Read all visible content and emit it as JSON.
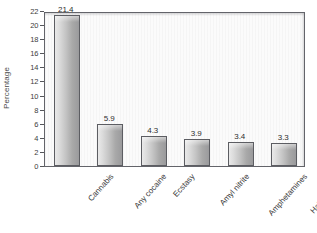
{
  "chart_data": {
    "type": "bar",
    "title": "",
    "xlabel": "",
    "ylabel": "Percentage",
    "ylim": [
      0,
      22
    ],
    "ytick_step": 2,
    "grid": false,
    "legend": null,
    "categories": [
      "Cannabis",
      "Any cocaine",
      "Ecstasy",
      "Amyl nitrite",
      "Amphetamines",
      "Hallucinogens"
    ],
    "values": [
      21.4,
      5.9,
      4.3,
      3.9,
      3.4,
      3.3
    ],
    "value_labels": [
      "21.4",
      "5.9",
      "4.3",
      "3.9",
      "3.4",
      "3.3"
    ],
    "ytick_labels": [
      "22",
      "20",
      "18",
      "16",
      "14",
      "12",
      "10",
      "8",
      "6",
      "4",
      "2",
      "0"
    ],
    "colors": {
      "bar_light": "#e9e9e9",
      "bar_dark": "#9a9a9c",
      "bar_border": "#5c5d62",
      "plot_background": "#fbfbfb",
      "axis": "#63646a",
      "text": "#3a3a3a"
    }
  }
}
